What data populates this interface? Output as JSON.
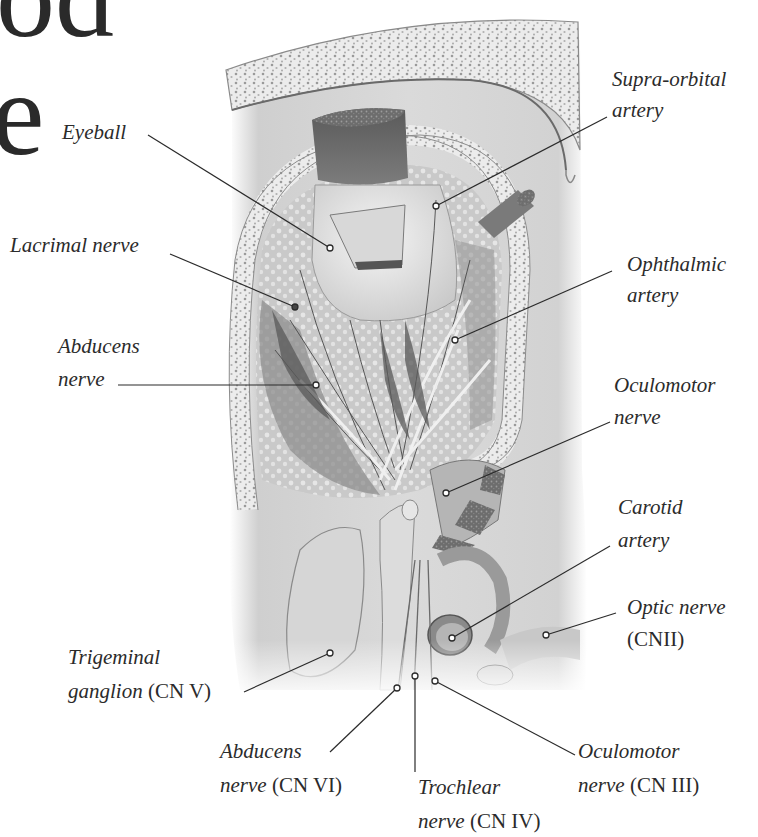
{
  "title_fragments": {
    "top": "od",
    "middle": "e"
  },
  "figure": {
    "colors": {
      "ink": "#2b2b2b",
      "bone": "#e9e9e9",
      "tissue": "#bdbdbd",
      "shadow": "#7a7a7a",
      "background": "#ffffff"
    }
  },
  "labels": [
    {
      "id": "eyeball",
      "italic": "Eyeball",
      "roman": ""
    },
    {
      "id": "supraorbital-artery",
      "italic_line1": "Supra-orbital",
      "italic_line2": "artery"
    },
    {
      "id": "lacrimal-nerve",
      "italic": "Lacrimal nerve"
    },
    {
      "id": "ophthalmic-artery",
      "italic_line1": "Ophthalmic",
      "italic_line2": "artery"
    },
    {
      "id": "abducens-nerve",
      "italic_line1": "Abducens",
      "italic_line2": "nerve"
    },
    {
      "id": "oculomotor-nerve",
      "italic_line1": "Oculomotor",
      "italic_line2": "nerve"
    },
    {
      "id": "carotid-artery",
      "italic_line1": "Carotid",
      "italic_line2": "artery"
    },
    {
      "id": "optic-nerve",
      "italic_line1": "Optic nerve",
      "roman_line2": "(CNII)"
    },
    {
      "id": "trigeminal-ganglion",
      "italic_line1": "Trigeminal",
      "italic_line2": "ganglion",
      "roman_line2": " (CN V)"
    },
    {
      "id": "abducens-nerve-cn6",
      "italic_line1": "Abducens",
      "italic_line2": "nerve",
      "roman_line2": " (CN VI)"
    },
    {
      "id": "trochlear-nerve",
      "italic_line1": "Trochlear",
      "italic_line2": "nerve",
      "roman_line2": " (CN IV)"
    },
    {
      "id": "oculomotor-nerve-cn3",
      "italic_line1": "Oculomotor",
      "italic_line2": "nerve",
      "roman_line2": " (CN III)"
    }
  ]
}
